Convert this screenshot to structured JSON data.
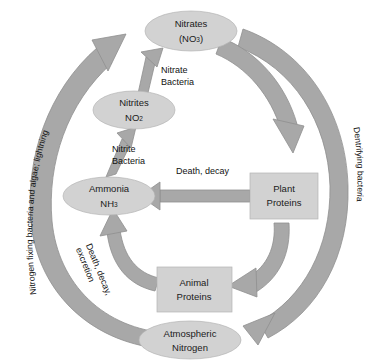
{
  "diagram": {
    "nodes": {
      "nitrates": {
        "line1": "Nitrates",
        "line2_main": "(NO",
        "line2_sub": "3",
        "line2_tail": ")"
      },
      "nitrites": {
        "line1": "Nitrites",
        "line2_main": "NO",
        "line2_sub": "2"
      },
      "ammonia": {
        "line1": "Ammonia",
        "line2_main": "NH",
        "line2_sub": "3"
      },
      "plant_proteins": {
        "line1": "Plant",
        "line2": "Proteins"
      },
      "animal_proteins": {
        "line1": "Animal",
        "line2": "Proteins"
      },
      "atmospheric_nitrogen": {
        "line1": "Atmospheric",
        "line2": "Nitrogen"
      }
    },
    "edge_labels": {
      "nitrate_bacteria_l1": "Nitrate",
      "nitrate_bacteria_l2": "Bacteria",
      "nitrite_bacteria_l1": "Nitrite",
      "nitrite_bacteria_l2": "Bacteria",
      "death_decay": "Death, decay",
      "death_decay_excretion_l1": "Death, decay,",
      "death_decay_excretion_l2": "excretion",
      "nitrogen_fixing": "Nitrogen fixing bacteria and algae; lightning",
      "denitrifying": "Dentrifying bacteria"
    },
    "colors": {
      "node_fill": "#d2d2d2",
      "node_stroke": "#b4b4b4",
      "arrow_fill": "#a8a8a8",
      "arrow_stroke": "#8f8f8f",
      "text": "#111111",
      "background": "#ffffff"
    }
  }
}
